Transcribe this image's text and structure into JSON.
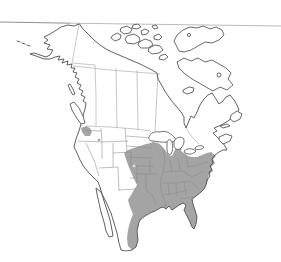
{
  "map": {
    "kind": "species-range-map",
    "region_shown": "North America",
    "colors": {
      "background": "#ffffff",
      "land": "#ffffff",
      "coastline": "#4f4f4f",
      "interior_border": "#9b9b9b",
      "state_border": "#8a8a8a",
      "range_fill": "#a4a4a4",
      "lake": "#ffffff",
      "top_rule": "#9f9f9f"
    },
    "shaded_areas": [
      {
        "id": "main-range",
        "description": "eastern-united-states-into-northeastern-mexico"
      },
      {
        "id": "pacific-northwest-patch",
        "description": "small-patch-western-washington"
      }
    ],
    "features": [
      "alaska",
      "aleutian-islands",
      "canadian-arctic-archipelago",
      "baffin-island",
      "hudson-bay",
      "newfoundland",
      "nova-scotia",
      "great-lakes",
      "vancouver-island",
      "baja-california",
      "gulf-of-mexico",
      "florida"
    ]
  }
}
